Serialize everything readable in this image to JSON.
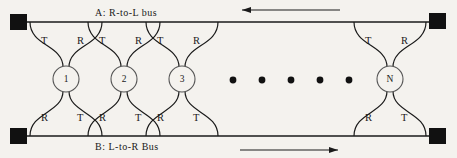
{
  "diagram": {
    "background_color": "#f4f2ee",
    "line_color": "#1a1a1a",
    "buses": {
      "top": {
        "id": "A",
        "label": "A:  R-to-L  bus",
        "direction": "right-to-left",
        "arrow_icon": "arrow-left-icon"
      },
      "bottom": {
        "id": "B",
        "label": "B:  L-to-R  Bus",
        "direction": "left-to-right",
        "arrow_icon": "arrow-right-icon"
      }
    },
    "terminators": [
      {
        "position": "top-left",
        "shape": "filled-square"
      },
      {
        "position": "top-right",
        "shape": "filled-square"
      },
      {
        "position": "bottom-left",
        "shape": "filled-square"
      },
      {
        "position": "bottom-right",
        "shape": "filled-square"
      }
    ],
    "nodes": [
      {
        "label": "1",
        "cx": 66,
        "taps": {
          "top_left": "T",
          "top_right": "R",
          "bottom_left": "R",
          "bottom_right": "T"
        }
      },
      {
        "label": "2",
        "cx": 124,
        "taps": {
          "top_left": "T",
          "top_right": "R",
          "bottom_left": "R",
          "bottom_right": "T"
        }
      },
      {
        "label": "3",
        "cx": 182,
        "taps": {
          "top_left": "T",
          "top_right": "R",
          "bottom_left": "R",
          "bottom_right": "T"
        }
      },
      {
        "label": "N",
        "cx": 390,
        "taps": {
          "top_left": "T",
          "top_right": "R",
          "bottom_left": "R",
          "bottom_right": "T"
        }
      }
    ],
    "ellipsis": {
      "label": "continuation-dots",
      "count": 5,
      "x_positions": [
        233,
        262,
        291,
        320,
        349
      ],
      "y": 80
    },
    "tap_legend": {
      "T": "Transmit tap",
      "R": "Receive tap"
    }
  }
}
